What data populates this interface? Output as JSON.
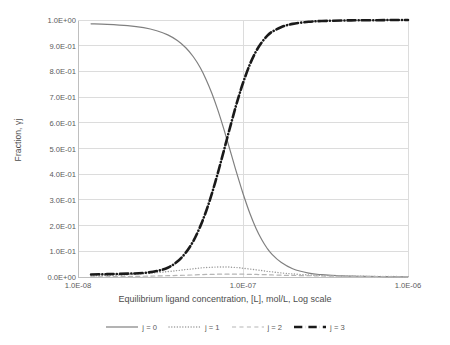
{
  "chart_data": {
    "type": "line",
    "title": "",
    "xlabel": "Equilibrium ligand concentration, [L], mol/L, Log scale",
    "ylabel": "Fraction, γj",
    "xscale": "log",
    "xlim": [
      1e-08,
      1e-06
    ],
    "ylim": [
      0.0,
      1.0
    ],
    "grid": true,
    "legend_position": "bottom",
    "xticks": [
      {
        "value": 1e-08,
        "label": "1.0E-08"
      },
      {
        "value": 1e-07,
        "label": "1.0E-07"
      },
      {
        "value": 1e-06,
        "label": "1.0E-06"
      }
    ],
    "yticks": [
      {
        "value": 0.0,
        "label": "0.0E+00"
      },
      {
        "value": 0.1,
        "label": "1.0E-01"
      },
      {
        "value": 0.2,
        "label": "2.0E-01"
      },
      {
        "value": 0.3,
        "label": "3.0E-01"
      },
      {
        "value": 0.4,
        "label": "4.0E-01"
      },
      {
        "value": 0.5,
        "label": "5.0E-01"
      },
      {
        "value": 0.6,
        "label": "6.0E-01"
      },
      {
        "value": 0.7,
        "label": "7.0E-01"
      },
      {
        "value": 0.8,
        "label": "8.0E-01"
      },
      {
        "value": 0.9,
        "label": "9.0E-01"
      },
      {
        "value": 1.0,
        "label": "1.0E+00"
      }
    ],
    "x": [
      1.2e-08,
      1.5e-08,
      2e-08,
      2.5e-08,
      3e-08,
      3.5e-08,
      4e-08,
      4.5e-08,
      5e-08,
      5.5e-08,
      6e-08,
      6.5e-08,
      7e-08,
      7.5e-08,
      8e-08,
      8.5e-08,
      9e-08,
      9.5e-08,
      1e-07,
      1.1e-07,
      1.2e-07,
      1.3e-07,
      1.4e-07,
      1.5e-07,
      1.7e-07,
      2e-07,
      2.5e-07,
      3e-07,
      4e-07,
      5e-07,
      6.5e-07,
      8e-07,
      1e-06
    ],
    "series": [
      {
        "name": "j = 0",
        "style": "solid",
        "color": "#808080",
        "width": 1.2,
        "values": [
          0.985,
          0.983,
          0.978,
          0.97,
          0.958,
          0.942,
          0.92,
          0.892,
          0.857,
          0.815,
          0.766,
          0.712,
          0.654,
          0.594,
          0.534,
          0.476,
          0.421,
          0.371,
          0.325,
          0.248,
          0.189,
          0.145,
          0.112,
          0.088,
          0.057,
          0.032,
          0.015,
          0.009,
          0.004,
          0.003,
          0.002,
          0.001,
          0.001
        ]
      },
      {
        "name": "j = 1",
        "style": "dotted",
        "color": "#9a9a9a",
        "width": 1.4,
        "values": [
          0.004,
          0.006,
          0.009,
          0.013,
          0.017,
          0.021,
          0.025,
          0.029,
          0.032,
          0.035,
          0.037,
          0.038,
          0.039,
          0.039,
          0.039,
          0.038,
          0.037,
          0.036,
          0.034,
          0.031,
          0.028,
          0.025,
          0.022,
          0.02,
          0.016,
          0.012,
          0.008,
          0.006,
          0.004,
          0.003,
          0.002,
          0.002,
          0.001
        ]
      },
      {
        "name": "j = 2",
        "style": "dashed",
        "color": "#b5b5b5",
        "width": 1.2,
        "values": [
          0.001,
          0.001,
          0.002,
          0.003,
          0.004,
          0.005,
          0.006,
          0.007,
          0.008,
          0.009,
          0.01,
          0.01,
          0.011,
          0.011,
          0.011,
          0.011,
          0.011,
          0.011,
          0.011,
          0.01,
          0.01,
          0.009,
          0.009,
          0.008,
          0.007,
          0.006,
          0.005,
          0.004,
          0.003,
          0.002,
          0.002,
          0.001,
          0.001
        ]
      },
      {
        "name": "j = 3",
        "style": "dashdot",
        "color": "#1a1a1a",
        "width": 2.6,
        "values": [
          0.01,
          0.011,
          0.013,
          0.016,
          0.023,
          0.036,
          0.06,
          0.095,
          0.14,
          0.196,
          0.259,
          0.328,
          0.399,
          0.47,
          0.538,
          0.601,
          0.659,
          0.71,
          0.755,
          0.827,
          0.878,
          0.913,
          0.938,
          0.954,
          0.972,
          0.985,
          0.993,
          0.996,
          0.998,
          0.999,
          0.999,
          1.0,
          1.0
        ]
      }
    ]
  },
  "axes": {
    "x_title": "Equilibrium ligand concentration, [L], mol/L, Log scale",
    "y_title": "Fraction, γj"
  },
  "legend": {
    "items": [
      {
        "label": "j = 0"
      },
      {
        "label": "j = 1"
      },
      {
        "label": "j = 2"
      },
      {
        "label": "j = 3"
      }
    ]
  },
  "colors": {
    "series_0": "#808080",
    "series_1": "#9a9a9a",
    "series_2": "#b5b5b5",
    "series_3": "#1a1a1a",
    "grid": "#dcdcdc",
    "axis": "#bfbfbf",
    "text": "#5a5a5a",
    "background": "#ffffff"
  }
}
